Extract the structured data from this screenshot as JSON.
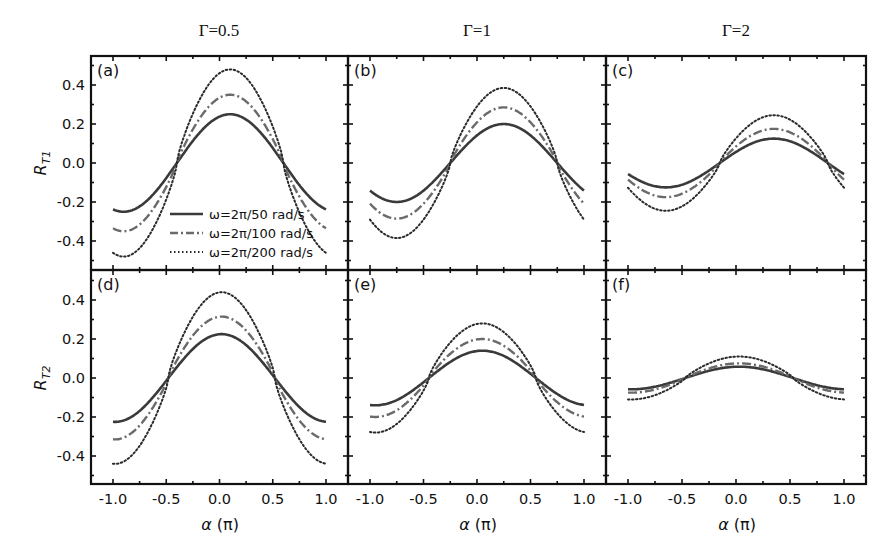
{
  "figure": {
    "column_titles": [
      "Γ=0.5",
      "Γ=1",
      "Γ=2"
    ],
    "row_ylabels": [
      {
        "main": "R",
        "sub": "T1"
      },
      {
        "main": "R",
        "sub": "T2"
      }
    ],
    "xlabel_main": "α",
    "xlabel_unit": " (π)",
    "panel_labels": [
      "(a)",
      "(b)",
      "(c)",
      "(d)",
      "(e)",
      "(f)"
    ],
    "xticks": [
      -1.0,
      -0.5,
      0.0,
      0.5,
      1.0
    ],
    "xtick_labels": [
      "-1.0",
      "-0.5",
      "0.0",
      "0.5",
      "1.0"
    ],
    "yticks": [
      -0.4,
      -0.2,
      0.0,
      0.2,
      0.4
    ],
    "ytick_labels": [
      "-0.4",
      "-0.2",
      "0.0",
      "0.2",
      "0.4"
    ],
    "legend": [
      {
        "label": "ω=2π/50 rad/s",
        "style": "solid"
      },
      {
        "label": "ω=2π/100 rad/s",
        "style": "dashdot"
      },
      {
        "label": "ω=2π/200 rad/s",
        "style": "dotted"
      }
    ],
    "colors": {
      "solid": "#3a3a3a",
      "dashdot": "#6a6a6a",
      "dotted": "#2a2a2a",
      "axes": "#111111"
    }
  },
  "chart_data": [
    {
      "type": "line",
      "panel": "(a)",
      "title": "Γ=0.5",
      "ylabel": "R_T1",
      "xlabel": "α (π)",
      "xlim": [
        -1.2,
        1.2
      ],
      "ylim": [
        -0.55,
        0.55
      ],
      "grid": false,
      "legend_position": "lower center",
      "x": [
        -1.0,
        -0.75,
        -0.5,
        -0.25,
        0.0,
        0.25,
        0.5,
        0.75,
        1.0
      ],
      "series": [
        {
          "name": "ω=2π/50 rad/s",
          "amp": 0.25,
          "phase": 0.1,
          "sharp": 1.0,
          "values": [
            -0.22,
            -0.25,
            -0.08,
            0.13,
            0.24,
            0.22,
            0.07,
            -0.12,
            -0.22
          ]
        },
        {
          "name": "ω=2π/100 rad/s",
          "amp": 0.35,
          "phase": 0.1,
          "sharp": 1.25,
          "values": [
            -0.31,
            -0.35,
            -0.1,
            0.17,
            0.34,
            0.3,
            0.08,
            -0.17,
            -0.31
          ]
        },
        {
          "name": "ω=2π/200 rad/s",
          "amp": 0.48,
          "phase": 0.1,
          "sharp": 1.55,
          "values": [
            -0.43,
            -0.48,
            -0.14,
            0.22,
            0.47,
            0.4,
            0.1,
            -0.24,
            -0.43
          ]
        }
      ]
    },
    {
      "type": "line",
      "panel": "(b)",
      "title": "Γ=1",
      "ylabel": "R_T1",
      "xlabel": "α (π)",
      "xlim": [
        -1.2,
        1.2
      ],
      "ylim": [
        -0.55,
        0.55
      ],
      "grid": false,
      "x": [
        -1.0,
        -0.75,
        -0.5,
        -0.25,
        0.0,
        0.25,
        0.5,
        0.75,
        1.0
      ],
      "series": [
        {
          "name": "ω=2π/50 rad/s",
          "amp": 0.2,
          "phase": 0.25,
          "sharp": 1.0,
          "values": [
            -0.14,
            -0.19,
            -0.14,
            0.0,
            0.14,
            0.2,
            0.14,
            0.0,
            -0.14
          ]
        },
        {
          "name": "ω=2π/100 rad/s",
          "amp": 0.285,
          "phase": 0.25,
          "sharp": 1.25,
          "values": [
            -0.19,
            -0.28,
            -0.19,
            0.0,
            0.19,
            0.29,
            0.19,
            0.0,
            -0.19
          ]
        },
        {
          "name": "ω=2π/200 rad/s",
          "amp": 0.385,
          "phase": 0.25,
          "sharp": 1.55,
          "values": [
            -0.28,
            -0.38,
            -0.26,
            0.0,
            0.26,
            0.39,
            0.26,
            0.0,
            -0.28
          ]
        }
      ]
    },
    {
      "type": "line",
      "panel": "(c)",
      "title": "Γ=2",
      "ylabel": "R_T1",
      "xlabel": "α (π)",
      "xlim": [
        -1.2,
        1.2
      ],
      "ylim": [
        -0.55,
        0.55
      ],
      "grid": false,
      "x": [
        -1.0,
        -0.75,
        -0.5,
        -0.25,
        0.0,
        0.25,
        0.5,
        0.75,
        1.0
      ],
      "series": [
        {
          "name": "ω=2π/50 rad/s",
          "amp": 0.125,
          "phase": 0.35,
          "sharp": 1.0,
          "values": [
            -0.06,
            -0.12,
            -0.11,
            -0.05,
            0.06,
            0.12,
            0.11,
            0.04,
            -0.06
          ]
        },
        {
          "name": "ω=2π/100 rad/s",
          "amp": 0.175,
          "phase": 0.35,
          "sharp": 1.2,
          "values": [
            -0.08,
            -0.17,
            -0.15,
            -0.06,
            0.08,
            0.17,
            0.15,
            0.05,
            -0.08
          ]
        },
        {
          "name": "ω=2π/200 rad/s",
          "amp": 0.245,
          "phase": 0.35,
          "sharp": 1.45,
          "values": [
            -0.11,
            -0.24,
            -0.21,
            -0.08,
            0.1,
            0.24,
            0.21,
            0.06,
            -0.11
          ]
        }
      ]
    },
    {
      "type": "line",
      "panel": "(d)",
      "title": "Γ=0.5",
      "ylabel": "R_T2",
      "xlabel": "α (π)",
      "xlim": [
        -1.2,
        1.2
      ],
      "ylim": [
        -0.55,
        0.55
      ],
      "grid": false,
      "x": [
        -1.0,
        -0.75,
        -0.5,
        -0.25,
        0.0,
        0.25,
        0.5,
        0.75,
        1.0
      ],
      "series": [
        {
          "name": "ω=2π/50 rad/s",
          "amp": 0.225,
          "phase": 0.02,
          "sharp": 1.0,
          "values": [
            -0.22,
            -0.17,
            -0.01,
            0.15,
            0.22,
            0.16,
            0.0,
            -0.16,
            -0.22
          ]
        },
        {
          "name": "ω=2π/100 rad/s",
          "amp": 0.315,
          "phase": 0.02,
          "sharp": 1.25,
          "values": [
            -0.31,
            -0.22,
            -0.01,
            0.21,
            0.31,
            0.22,
            0.0,
            -0.22,
            -0.31
          ]
        },
        {
          "name": "ω=2π/200 rad/s",
          "amp": 0.44,
          "phase": 0.02,
          "sharp": 1.55,
          "values": [
            -0.44,
            -0.3,
            -0.01,
            0.28,
            0.44,
            0.29,
            0.0,
            -0.3,
            -0.44
          ]
        }
      ]
    },
    {
      "type": "line",
      "panel": "(e)",
      "title": "Γ=1",
      "ylabel": "R_T2",
      "xlabel": "α (π)",
      "xlim": [
        -1.2,
        1.2
      ],
      "ylim": [
        -0.55,
        0.55
      ],
      "grid": false,
      "x": [
        -1.0,
        -0.75,
        -0.5,
        -0.25,
        0.0,
        0.25,
        0.5,
        0.75,
        1.0
      ],
      "series": [
        {
          "name": "ω=2π/50 rad/s",
          "amp": 0.14,
          "phase": 0.05,
          "sharp": 1.0,
          "values": [
            -0.14,
            -0.11,
            -0.02,
            0.09,
            0.14,
            0.11,
            0.01,
            -0.09,
            -0.14
          ]
        },
        {
          "name": "ω=2π/100 rad/s",
          "amp": 0.2,
          "phase": 0.05,
          "sharp": 1.25,
          "values": [
            -0.2,
            -0.15,
            -0.02,
            0.12,
            0.2,
            0.15,
            0.01,
            -0.13,
            -0.2
          ]
        },
        {
          "name": "ω=2π/200 rad/s",
          "amp": 0.28,
          "phase": 0.05,
          "sharp": 1.55,
          "values": [
            -0.28,
            -0.2,
            -0.03,
            0.16,
            0.28,
            0.2,
            0.01,
            -0.18,
            -0.28
          ]
        }
      ]
    },
    {
      "type": "line",
      "panel": "(f)",
      "title": "Γ=2",
      "ylabel": "R_T2",
      "xlabel": "α (π)",
      "xlim": [
        -1.2,
        1.2
      ],
      "ylim": [
        -0.55,
        0.55
      ],
      "grid": false,
      "x": [
        -1.0,
        -0.75,
        -0.5,
        -0.25,
        0.0,
        0.25,
        0.5,
        0.75,
        1.0
      ],
      "series": [
        {
          "name": "ω=2π/50 rad/s",
          "amp": 0.058,
          "phase": 0.03,
          "sharp": 1.0,
          "values": [
            -0.055,
            -0.04,
            -0.01,
            0.04,
            0.058,
            0.045,
            0.0,
            -0.04,
            -0.055
          ]
        },
        {
          "name": "ω=2π/100 rad/s",
          "amp": 0.075,
          "phase": 0.03,
          "sharp": 1.15,
          "values": [
            -0.07,
            -0.05,
            -0.01,
            0.05,
            0.075,
            0.055,
            0.0,
            -0.05,
            -0.07
          ]
        },
        {
          "name": "ω=2π/200 rad/s",
          "amp": 0.11,
          "phase": 0.03,
          "sharp": 1.4,
          "values": [
            -0.11,
            -0.08,
            -0.01,
            0.07,
            0.11,
            0.08,
            0.0,
            -0.08,
            -0.11
          ]
        }
      ]
    }
  ]
}
